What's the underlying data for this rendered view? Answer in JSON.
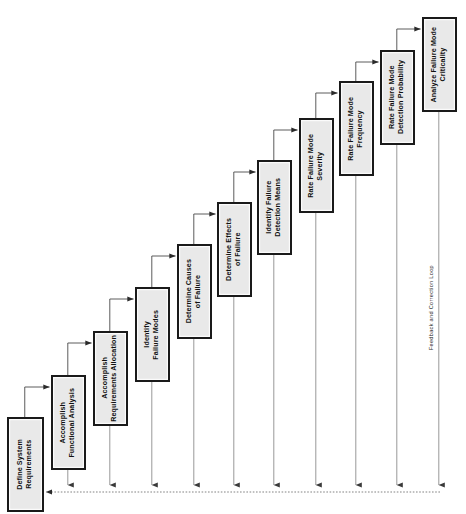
{
  "diagram": {
    "type": "process-flow-staircase",
    "orientation": "rotated-90-ccw",
    "canvas": {
      "width": 466,
      "height": 514
    },
    "background_color": "#ffffff",
    "node_fill_color": "#e9e9e9",
    "node_border_color": "#1a1a1a",
    "connector_color": "#4a4a4a",
    "feedback_line_color": "#777777",
    "nodes": [
      {
        "id": "n1",
        "label": "Define System\nRequirements",
        "x": 7,
        "y": 417,
        "w": 37,
        "h": 95
      },
      {
        "id": "n2",
        "label": "Accomplish\nFunctional Analysis",
        "x": 51,
        "y": 375,
        "w": 35,
        "h": 95
      },
      {
        "id": "n3",
        "label": "Accomplish\nRequirements Allocation",
        "x": 93,
        "y": 331,
        "w": 35,
        "h": 95
      },
      {
        "id": "n4",
        "label": "Identify\nFailure Modes",
        "x": 135,
        "y": 287,
        "w": 35,
        "h": 95
      },
      {
        "id": "n5",
        "label": "Determine Causes\nof Failure",
        "x": 177,
        "y": 244,
        "w": 35,
        "h": 95
      },
      {
        "id": "n6",
        "label": "Determine Effects\nof Failure",
        "x": 217,
        "y": 202,
        "w": 35,
        "h": 95
      },
      {
        "id": "n7",
        "label": "Identify Failure\nDetection Means",
        "x": 257,
        "y": 160,
        "w": 35,
        "h": 95
      },
      {
        "id": "n8",
        "label": "Rate Failure Mode\nSeverity",
        "x": 299,
        "y": 118,
        "w": 35,
        "h": 95
      },
      {
        "id": "n9",
        "label": "Rate Failure Mode\nFrequency",
        "x": 339,
        "y": 81,
        "w": 35,
        "h": 95
      },
      {
        "id": "n10",
        "label": "Rate Failure Mode\nDetection Probability",
        "x": 380,
        "y": 50,
        "w": 35,
        "h": 95
      },
      {
        "id": "n11",
        "label": "Analyze Failure Mode\nCriticality",
        "x": 422,
        "y": 17,
        "w": 35,
        "h": 95
      }
    ],
    "feedback_loop": {
      "caption": "Feedback and Correction Loop",
      "caption_x": 428,
      "caption_y": 265,
      "line_y": 492,
      "line_x_start": 30,
      "line_x_end": 440,
      "target_node": "n1"
    },
    "connector_sequence": [
      "n1 -> n2",
      "n2 -> n3",
      "n3 -> n4",
      "n4 -> n5",
      "n5 -> n6",
      "n6 -> n7",
      "n7 -> n8",
      "n8 -> n9",
      "n9 -> n10",
      "n10 -> n11"
    ]
  }
}
